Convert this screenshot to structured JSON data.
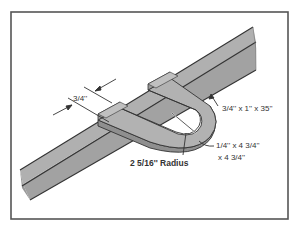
{
  "diagram": {
    "colors": {
      "frame": "#555555",
      "bar_fill": "#a9a9a9",
      "bar_top": "#b5b5b5",
      "bar_side": "#9a9a9a",
      "outline": "#333333",
      "background": "#ffffff"
    },
    "labels": {
      "width_dimension": "3/4''",
      "bar_dimensions": "3/4'' x 1'' x 35''",
      "plate_dimensions_line1": "1/4'' x 4 3/4''",
      "plate_dimensions_line2": "x 4 3/4''",
      "radius": "2 5/16'' Radius"
    }
  }
}
